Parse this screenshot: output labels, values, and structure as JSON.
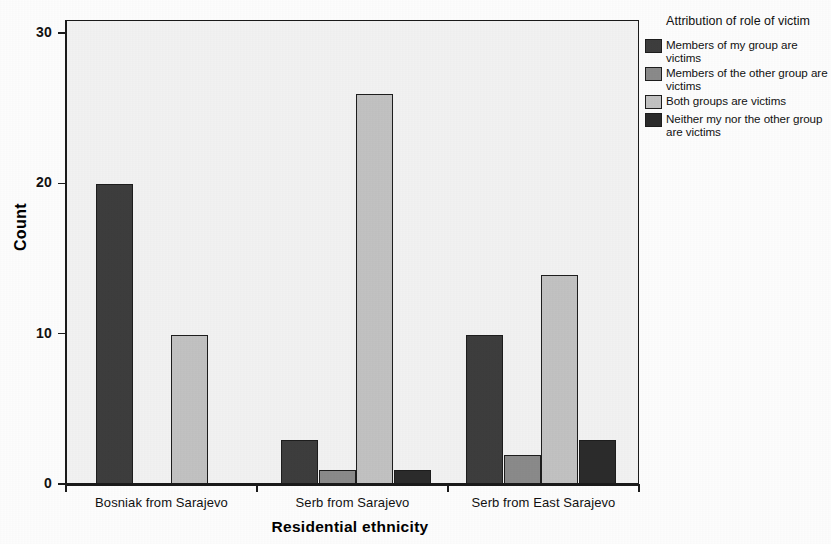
{
  "chart_data": {
    "type": "bar",
    "title": "",
    "subtitle": "",
    "xlabel": "Residential ethnicity",
    "ylabel": "Count",
    "categories": [
      "Bosniak from Sarajevo",
      "Serb from Sarajevo",
      "Serb from East Sarajevo"
    ],
    "legend_title": "Attribution of role of victim",
    "legend_position": "right",
    "grid": false,
    "ylim": [
      0,
      31
    ],
    "yticks": [
      "0",
      "10",
      "20",
      "30"
    ],
    "ytick_values": [
      0,
      10,
      20,
      30
    ],
    "grouping": "clustered",
    "series": [
      {
        "name": "Members of my group are victims",
        "color": "#3d3d3d",
        "values": [
          20,
          3,
          10
        ]
      },
      {
        "name": "Members of the other group are victims",
        "color": "#8a8a8a",
        "values": [
          null,
          1,
          2
        ]
      },
      {
        "name": "Both groups are victims",
        "color": "#c2c2c2",
        "values": [
          10,
          26,
          14
        ]
      },
      {
        "name": "Neither my nor the other group are victims",
        "color": "#2b2b2b",
        "values": [
          null,
          1,
          3
        ]
      }
    ]
  },
  "axes": {
    "y_title": "Count",
    "x_title": "Residential ethnicity",
    "y_tick_labels": [
      "30",
      "20",
      "10",
      "0"
    ],
    "x_tick_labels": [
      "Bosniak from Sarajevo",
      "Serb from Sarajevo",
      "Serb from East Sarajevo"
    ]
  },
  "legend": {
    "title": "Attribution of role of victim",
    "items": [
      {
        "label": "Members of my group are victims",
        "color": "#3d3d3d"
      },
      {
        "label": "Members of the other group are victims",
        "color": "#8a8a8a"
      },
      {
        "label": "Both groups are victims",
        "color": "#c2c2c2"
      },
      {
        "label": "Neither my nor the other group are victims",
        "color": "#2b2b2b"
      }
    ]
  },
  "plot_style": {
    "background": "#f2f2f2",
    "frame_color": "#1a1a1a",
    "page_background": "#fdfdfd"
  }
}
